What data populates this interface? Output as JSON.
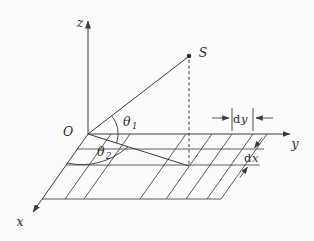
{
  "diagram": {
    "axes": {
      "z": "z",
      "y": "y",
      "x": "x"
    },
    "origin_label": "O",
    "source_point_label": "S",
    "angles": {
      "theta1": {
        "symbol": "θ",
        "subscript": "1"
      },
      "theta2": {
        "symbol": "θ",
        "subscript": "2"
      }
    },
    "differentials": {
      "dy": {
        "operator": "d",
        "variable": "y"
      },
      "dx": {
        "operator": "d",
        "variable": "x"
      }
    },
    "colors": {
      "line": "#3a3a3a",
      "background": "#fbfbfb"
    }
  }
}
